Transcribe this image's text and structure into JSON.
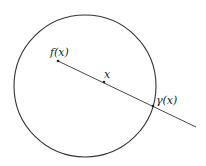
{
  "diagram": {
    "labels": {
      "f_x": "f(x)",
      "x": "x",
      "gamma_x": "γ(x)"
    },
    "colors": {
      "stroke": "#333333",
      "background": "#ffffff"
    }
  }
}
